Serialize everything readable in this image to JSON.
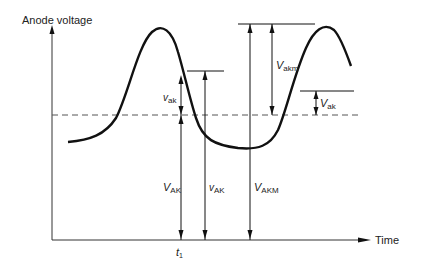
{
  "diagram": {
    "y_axis_label": "Anode voltage",
    "x_axis_label": "Time",
    "time_marker": {
      "main": "t",
      "sub": "1"
    },
    "labels": {
      "v_ak_left": {
        "main": "v",
        "sub": "ak"
      },
      "V_AK": {
        "main": "V",
        "sub": "AK"
      },
      "v_AK": {
        "main": "v",
        "sub": "AK"
      },
      "V_AKM": {
        "main": "V",
        "sub": "AKM"
      },
      "V_akm": {
        "main": "V",
        "sub": "akm"
      },
      "V_ak_right": {
        "main": "V",
        "sub": "ak"
      }
    },
    "colors": {
      "line": "#111111",
      "axis": "#333333",
      "dash": "#555555",
      "background": "#ffffff"
    }
  }
}
